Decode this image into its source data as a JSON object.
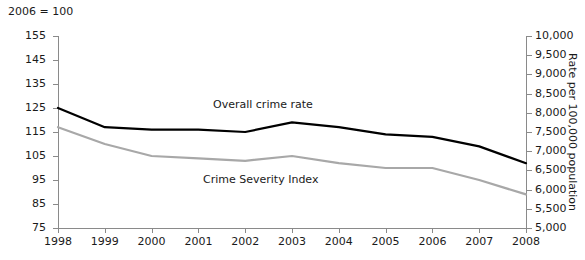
{
  "note": "2006 = 100",
  "chart_data": {
    "type": "line",
    "title": "",
    "subtitle": "",
    "xlabel": "",
    "ylabel": "",
    "ylabel_right": "Rate per 100,000 population",
    "index_base_note": "2006 = 100",
    "grid": false,
    "legend_position": "inline-annotations",
    "x": [
      1998,
      1999,
      2000,
      2001,
      2002,
      2003,
      2004,
      2005,
      2006,
      2007,
      2008
    ],
    "categories": [
      "1998",
      "1999",
      "2000",
      "2001",
      "2002",
      "2003",
      "2004",
      "2005",
      "2006",
      "2007",
      "2008"
    ],
    "ylim": [
      75,
      155
    ],
    "yticks": [
      75,
      85,
      95,
      105,
      115,
      125,
      135,
      145,
      155
    ],
    "ytick_labels": [
      "75",
      "85",
      "95",
      "105",
      "115",
      "125",
      "135",
      "145",
      "155"
    ],
    "ylim_right": [
      5000,
      10000
    ],
    "yticks_right": [
      5000,
      5500,
      6000,
      6500,
      7000,
      7500,
      8000,
      8500,
      9000,
      9500,
      10000
    ],
    "ytick_labels_right": [
      "5,000",
      "5,500",
      "6,000",
      "6,500",
      "7,000",
      "7,500",
      "8,000",
      "8,500",
      "9,000",
      "9,500",
      "10,000"
    ],
    "series": [
      {
        "name": "Overall crime rate",
        "color": "#000000",
        "values": [
          125,
          117,
          116,
          116,
          115,
          119,
          117,
          114,
          113,
          109,
          102
        ]
      },
      {
        "name": "Crime Severity Index",
        "color": "#a8a8a8",
        "values": [
          117,
          110,
          105,
          104,
          103,
          105,
          102,
          100,
          100,
          95,
          89
        ]
      }
    ],
    "annotations": [
      {
        "text": "Overall crime rate",
        "series": "Overall crime rate"
      },
      {
        "text": "Crime Severity Index",
        "series": "Crime Severity Index"
      }
    ]
  }
}
